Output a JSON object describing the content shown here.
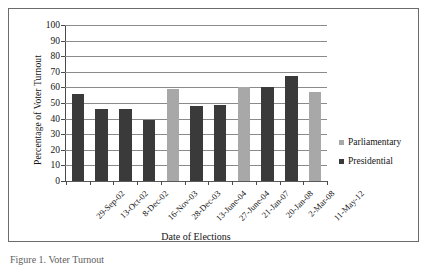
{
  "chart_data": {
    "type": "bar",
    "title": "",
    "xlabel": "Date of Elections",
    "ylabel": "Percentage of Voter Turnout",
    "ylim": [
      0,
      100
    ],
    "ytick_step": 10,
    "yticks": [
      100,
      90,
      80,
      70,
      60,
      50,
      40,
      30,
      20,
      10,
      0
    ],
    "grid": true,
    "legend_position": "right",
    "categories": [
      "29-Sep-02",
      "13-Oct-02",
      "8-Dec-02",
      "16-Nov-03",
      "28-Dec-03",
      "13-June-04",
      "27-June-04",
      "21-Jan-07",
      "20-Jan-08",
      "2-Mar-08",
      "11-May-12"
    ],
    "values": [
      56,
      46,
      46,
      39,
      59,
      48,
      49,
      60,
      60,
      67,
      57
    ],
    "point_types": [
      "Presidential",
      "Presidential",
      "Presidential",
      "Presidential",
      "Parliamentary",
      "Presidential",
      "Presidential",
      "Parliamentary",
      "Presidential",
      "Presidential",
      "Parliamentary"
    ],
    "series": [
      {
        "name": "Parliamentary",
        "color": "#a8a8a8",
        "values": [
          null,
          null,
          null,
          null,
          59,
          null,
          null,
          60,
          null,
          null,
          57
        ]
      },
      {
        "name": "Presidential",
        "color": "#3a3a3a",
        "values": [
          56,
          46,
          46,
          39,
          null,
          48,
          49,
          null,
          60,
          67,
          null
        ]
      }
    ]
  },
  "legend": {
    "items": [
      {
        "label": "Parliamentary",
        "color": "#a8a8a8"
      },
      {
        "label": "Presidential",
        "color": "#3a3a3a"
      }
    ]
  },
  "caption": {
    "text": "Figure 1. Voter Turnout"
  },
  "colors": {
    "parliamentary": "#a8a8a8",
    "presidential": "#3a3a3a",
    "gridline": "#8a8a8a",
    "axis": "#4a4a4a",
    "frame": "#6b6b6b"
  }
}
